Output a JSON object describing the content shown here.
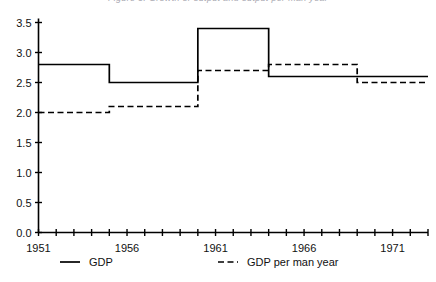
{
  "title_fragment": "Figure 3.  Growth of output and output per man year",
  "chart_data": {
    "type": "line",
    "title": "",
    "xlabel": "",
    "ylabel": "",
    "xlim": [
      1951,
      1973
    ],
    "ylim": [
      0.0,
      3.5
    ],
    "grid": false,
    "step": "post",
    "legend_position": "bottom",
    "x_tick_labels": [
      "1951",
      "1956",
      "1961",
      "1966",
      "1971"
    ],
    "x_tick_values": [
      1951,
      1956,
      1961,
      1966,
      1971
    ],
    "x_minor_ticks": [
      1951,
      1952,
      1953,
      1954,
      1955,
      1956,
      1957,
      1958,
      1959,
      1960,
      1961,
      1962,
      1963,
      1964,
      1965,
      1966,
      1967,
      1968,
      1969,
      1970,
      1971,
      1972,
      1973
    ],
    "y_tick_labels": [
      "0.0",
      "0.5",
      "1.0",
      "1.5",
      "2.0",
      "2.5",
      "3.0",
      "3.5"
    ],
    "y_tick_values": [
      0.0,
      0.5,
      1.0,
      1.5,
      2.0,
      2.5,
      3.0,
      3.5
    ],
    "series": [
      {
        "name": "GDP",
        "style": "solid",
        "color": "#000000",
        "segments": [
          {
            "x_start": 1951,
            "x_end": 1955,
            "value": 2.8
          },
          {
            "x_start": 1955,
            "x_end": 1960,
            "value": 2.5
          },
          {
            "x_start": 1960,
            "x_end": 1964,
            "value": 3.4
          },
          {
            "x_start": 1964,
            "x_end": 1973,
            "value": 2.6
          }
        ]
      },
      {
        "name": "GDP per man year",
        "style": "dashed",
        "color": "#000000",
        "segments": [
          {
            "x_start": 1951,
            "x_end": 1955,
            "value": 2.0
          },
          {
            "x_start": 1955,
            "x_end": 1960,
            "value": 2.1
          },
          {
            "x_start": 1960,
            "x_end": 1964,
            "value": 2.7
          },
          {
            "x_start": 1964,
            "x_end": 1969,
            "value": 2.8
          },
          {
            "x_start": 1969,
            "x_end": 1973,
            "value": 2.5
          }
        ]
      }
    ],
    "legend": [
      {
        "label": "GDP",
        "style": "solid"
      },
      {
        "label": "GDP per man year",
        "style": "dashed"
      }
    ]
  }
}
